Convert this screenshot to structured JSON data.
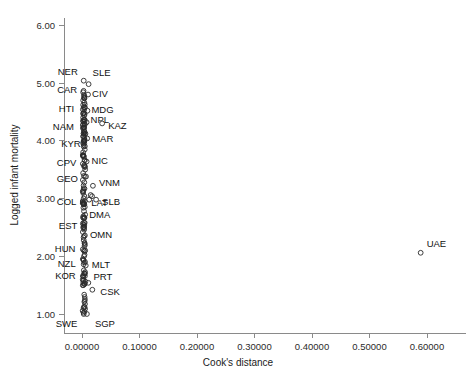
{
  "chart_data": {
    "type": "scatter",
    "title": "",
    "xlabel": "Cook's distance",
    "ylabel": "Logged infant mortality",
    "xlim": [
      -0.018,
      0.655
    ],
    "ylim": [
      0.62,
      6.35
    ],
    "grid": false,
    "legend": null,
    "xticks": [
      "0.00000",
      "0.10000",
      "0.20000",
      "0.30000",
      "0.40000",
      "0.50000",
      "0.60000"
    ],
    "xtick_values": [
      0.0,
      0.1,
      0.2,
      0.3,
      0.4,
      0.5,
      0.6
    ],
    "yticks": [
      "1.00",
      "2.00",
      "3.00",
      "4.00",
      "5.00",
      "6.00"
    ],
    "ytick_values": [
      1.0,
      2.0,
      3.0,
      4.0,
      5.0,
      6.0
    ],
    "marker": "open-circle",
    "points": [
      {
        "x": 0.003,
        "y": 5.04,
        "label": "NER",
        "label_dx": -26,
        "label_dy": -6
      },
      {
        "x": 0.0115,
        "y": 4.98,
        "label": "SLE",
        "label_dx": 4,
        "label_dy": -8
      },
      {
        "x": 0.002,
        "y": 4.84,
        "label": "CAR",
        "label_dx": -26,
        "label_dy": 1
      },
      {
        "x": 0.0105,
        "y": 4.8,
        "label": "CIV",
        "label_dx": 4,
        "label_dy": 2
      },
      {
        "x": 0.0035,
        "y": 4.74,
        "label": null
      },
      {
        "x": 0.002,
        "y": 4.7,
        "label": null
      },
      {
        "x": 0.004,
        "y": 4.66,
        "label": null
      },
      {
        "x": 0.002,
        "y": 4.62,
        "label": null
      },
      {
        "x": 0.003,
        "y": 4.58,
        "label": null
      },
      {
        "x": 0.0015,
        "y": 4.54,
        "label": "HTI",
        "label_dx": -24,
        "label_dy": 2
      },
      {
        "x": 0.0095,
        "y": 4.52,
        "label": "MDG",
        "label_dx": 4,
        "label_dy": 2
      },
      {
        "x": 0.0025,
        "y": 4.48,
        "label": null
      },
      {
        "x": 0.004,
        "y": 4.44,
        "label": null
      },
      {
        "x": 0.002,
        "y": 4.4,
        "label": null
      },
      {
        "x": 0.003,
        "y": 4.36,
        "label": null
      },
      {
        "x": 0.008,
        "y": 4.32,
        "label": "NPL",
        "label_dx": 4,
        "label_dy": 1
      },
      {
        "x": 0.002,
        "y": 4.28,
        "label": null
      },
      {
        "x": 0.035,
        "y": 4.3,
        "label": "KAZ",
        "label_dx": 6,
        "label_dy": 6
      },
      {
        "x": 0.0015,
        "y": 4.22,
        "label": "NAM",
        "label_dx": -30,
        "label_dy": 2
      },
      {
        "x": 0.0035,
        "y": 4.18,
        "label": null
      },
      {
        "x": 0.006,
        "y": 4.12,
        "label": null
      },
      {
        "x": 0.0025,
        "y": 4.08,
        "label": null
      },
      {
        "x": 0.009,
        "y": 4.04,
        "label": "MAR",
        "label_dx": 5,
        "label_dy": 4
      },
      {
        "x": 0.004,
        "y": 4.0,
        "label": null
      },
      {
        "x": 0.002,
        "y": 3.96,
        "label": null
      },
      {
        "x": 0.003,
        "y": 3.9,
        "label": null
      },
      {
        "x": 0.002,
        "y": 3.8,
        "label": "KYR",
        "label_dx": -22,
        "label_dy": -5
      },
      {
        "x": 0.0035,
        "y": 3.72,
        "label": null
      },
      {
        "x": 0.008,
        "y": 3.64,
        "label": "NIC",
        "label_dx": 5,
        "label_dy": 2
      },
      {
        "x": 0.0015,
        "y": 3.6,
        "label": "CPV",
        "label_dx": -26,
        "label_dy": 2
      },
      {
        "x": 0.0035,
        "y": 3.56,
        "label": null
      },
      {
        "x": 0.0055,
        "y": 3.5,
        "label": null
      },
      {
        "x": 0.002,
        "y": 3.44,
        "label": null
      },
      {
        "x": 0.007,
        "y": 3.38,
        "label": null
      },
      {
        "x": 0.0015,
        "y": 3.32,
        "label": "GEO",
        "label_dx": -26,
        "label_dy": 2
      },
      {
        "x": 0.004,
        "y": 3.28,
        "label": null
      },
      {
        "x": 0.019,
        "y": 3.22,
        "label": "VNM",
        "label_dx": 6,
        "label_dy": 0
      },
      {
        "x": 0.003,
        "y": 3.18,
        "label": null
      },
      {
        "x": 0.002,
        "y": 3.12,
        "label": null
      },
      {
        "x": 0.015,
        "y": 3.06,
        "label": null
      },
      {
        "x": 0.0175,
        "y": 3.04,
        "label": null
      },
      {
        "x": 0.003,
        "y": 3.0,
        "label": null
      },
      {
        "x": 0.0125,
        "y": 2.98,
        "label": "LAT",
        "label_dx": 2,
        "label_dy": 6
      },
      {
        "x": 0.0245,
        "y": 2.98,
        "label": "SLB",
        "label_dx": 6,
        "label_dy": 5
      },
      {
        "x": 0.0015,
        "y": 2.94,
        "label": "COL",
        "label_dx": -26,
        "label_dy": 3
      },
      {
        "x": 0.004,
        "y": 2.9,
        "label": null
      },
      {
        "x": 0.0025,
        "y": 2.84,
        "label": null
      },
      {
        "x": 0.0035,
        "y": 2.78,
        "label": null
      },
      {
        "x": 0.0055,
        "y": 2.72,
        "label": "DMA",
        "label_dx": 4,
        "label_dy": 3
      },
      {
        "x": 0.0025,
        "y": 2.66,
        "label": null
      },
      {
        "x": 0.0035,
        "y": 2.58,
        "label": null
      },
      {
        "x": 0.002,
        "y": 2.5,
        "label": null
      },
      {
        "x": 0.0015,
        "y": 2.42,
        "label": "EST",
        "label_dx": -24,
        "label_dy": -3
      },
      {
        "x": 0.005,
        "y": 2.36,
        "label": "OMN",
        "label_dx": 5,
        "label_dy": 3
      },
      {
        "x": 0.003,
        "y": 2.28,
        "label": null
      },
      {
        "x": 0.0045,
        "y": 2.18,
        "label": null
      },
      {
        "x": 0.0015,
        "y": 2.12,
        "label": "HUN",
        "label_dx": -28,
        "label_dy": 3
      },
      {
        "x": 0.0055,
        "y": 2.1,
        "label": null
      },
      {
        "x": 0.0035,
        "y": 2.0,
        "label": null
      },
      {
        "x": 0.003,
        "y": 1.86,
        "label": "NZL",
        "label_dx": -26,
        "label_dy": 3
      },
      {
        "x": 0.0065,
        "y": 1.84,
        "label": "MLT",
        "label_dx": 6,
        "label_dy": 3
      },
      {
        "x": 0.0045,
        "y": 1.7,
        "label": null
      },
      {
        "x": 0.002,
        "y": 1.58,
        "label": "KOR",
        "label_dx": -28,
        "label_dy": -2
      },
      {
        "x": 0.006,
        "y": 1.56,
        "label": "PRT",
        "label_dx": 8,
        "label_dy": -2
      },
      {
        "x": 0.011,
        "y": 1.54,
        "label": null
      },
      {
        "x": 0.018,
        "y": 1.42,
        "label": "CSK",
        "label_dx": 8,
        "label_dy": 5
      },
      {
        "x": 0.0045,
        "y": 1.12,
        "label": null
      },
      {
        "x": 0.003,
        "y": 1.0,
        "label": "SWE",
        "label_dx": -28,
        "label_dy": 13
      },
      {
        "x": 0.0085,
        "y": 1.0,
        "label": "SGP",
        "label_dx": 8,
        "label_dy": 13
      },
      {
        "x": 0.589,
        "y": 2.06,
        "label": "UAE",
        "label_dx": 6,
        "label_dy": -6
      }
    ],
    "dense_column": {
      "description": "dense overplotted column of open circles near x=0",
      "x_range": [
        0.001,
        0.0055
      ],
      "y_range": [
        1.0,
        4.9
      ],
      "count": 120
    }
  }
}
